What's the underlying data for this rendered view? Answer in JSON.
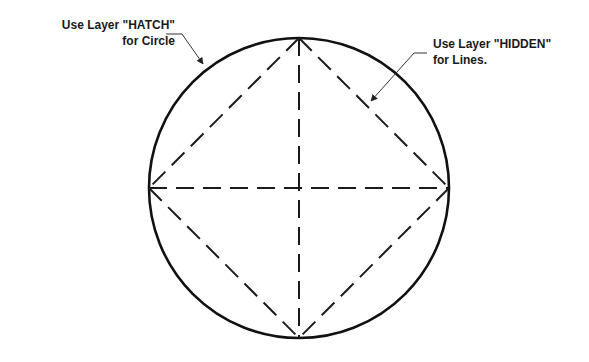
{
  "annotations": {
    "circle_note": {
      "line1": "Use Layer \"HATCH\"",
      "line2": "for Circle"
    },
    "lines_note": {
      "line1": "Use Layer \"HIDDEN\"",
      "line2": "for Lines."
    }
  },
  "drawing": {
    "circle": {
      "cx": 299,
      "cy": 188,
      "r": 150,
      "layer": "HATCH",
      "stroke": "#111111"
    },
    "dashed_lines_layer": "HIDDEN",
    "dash_color": "#1a1a1a"
  }
}
